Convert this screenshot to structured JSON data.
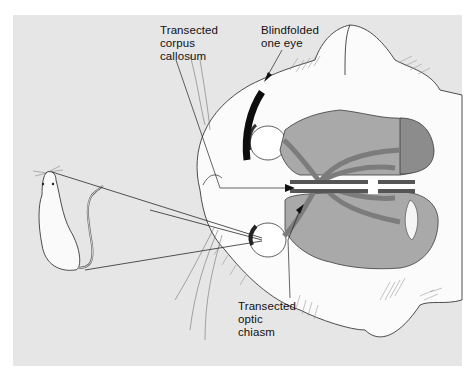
{
  "figure": {
    "colors": {
      "background": "#ffffff",
      "panel": "#e6e6e6",
      "cat_head": "#fbfbfb",
      "brain": "#a9a9a9",
      "cerebellum": "#8c8c8c",
      "optic_tract": "#7c7c7c",
      "blindfold": "#0d0d0d",
      "outline": "#3a3a3a"
    }
  },
  "labels": {
    "corpus_callosum": {
      "line1": "Transected",
      "line2": "corpus",
      "line3": "callosum"
    },
    "blindfold": {
      "line1": "Blindfolded",
      "line2": "one eye"
    },
    "optic_chiasm": {
      "line1": "Transected",
      "line2": "optic",
      "line3": "chiasm"
    }
  },
  "elements": {
    "stimulus": "rat",
    "subject": "cat-head-top-view"
  }
}
